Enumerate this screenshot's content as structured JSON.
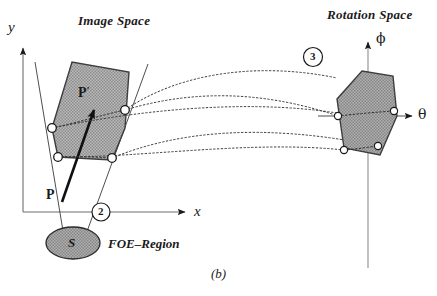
{
  "figure": {
    "caption": "(b)",
    "background_color": "#ffffff",
    "ink_color": "#1a1a1a",
    "polygon_fill": "#a8a8a8",
    "ellipse_fill": "#9c9c9c"
  },
  "image_space": {
    "title": "Image Space",
    "y_axis_label": "y",
    "x_axis_label": "x",
    "point_label": "P",
    "point_prime_label": "P",
    "point_prime_mark": "′",
    "foe_region_label": "FOE–Region",
    "foe_ellipse_label": "S",
    "marker_number": "2"
  },
  "rotation_space": {
    "title": "Rotation Space",
    "phi_axis_label": "ϕ",
    "theta_axis_label": "θ",
    "marker_number": "3"
  },
  "geometry": {
    "image_polygon_points": "52,128 72,62 129,72 125,128 112,160 58,157",
    "rotation_polygon_points": "337,99 362,71 393,76 397,116 380,155 344,148",
    "image_vertices": [
      {
        "name": "left-vertex",
        "x": 52,
        "y": 128
      },
      {
        "name": "right-vertex",
        "x": 125,
        "y": 110
      },
      {
        "name": "bottom-left-vertex",
        "x": 58,
        "y": 157
      },
      {
        "name": "bottom-right-vertex",
        "x": 112,
        "y": 158
      }
    ],
    "rotation_vertices": [
      {
        "name": "left-vertex",
        "x": 338,
        "y": 116
      },
      {
        "name": "right-vertex",
        "x": 394,
        "y": 111
      },
      {
        "name": "bottom-left-vertex",
        "x": 344,
        "y": 150
      },
      {
        "name": "bottom-mid-vertex",
        "x": 378,
        "y": 146
      }
    ],
    "connector_curves": 4
  }
}
